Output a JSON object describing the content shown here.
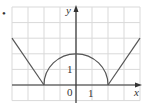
{
  "figure": {
    "marker": "•",
    "axis_labels": {
      "x": "x",
      "y": "y"
    },
    "tick_labels": {
      "origin": "0",
      "x_one": "1",
      "y_one": "1"
    }
  },
  "chart_data": {
    "type": "line",
    "title": "",
    "xlabel": "x",
    "ylabel": "y",
    "grid": true,
    "xlim": [
      -4,
      4
    ],
    "ylim": [
      -1,
      5
    ],
    "series": [
      {
        "name": "left line",
        "x": [
          -4,
          -2
        ],
        "y": [
          3,
          0
        ]
      },
      {
        "name": "semicircle",
        "shape": "upper semicircle centered (0,0) radius 2",
        "x": [
          -2,
          -1,
          0,
          1,
          2
        ],
        "y": [
          0,
          1.73,
          2,
          1.73,
          0
        ]
      },
      {
        "name": "right line",
        "x": [
          2,
          4
        ],
        "y": [
          0,
          3
        ]
      }
    ],
    "annotations": [
      "0",
      "1 (x-axis)",
      "1 (y-axis)"
    ]
  },
  "colors": {
    "grid": "#d9d9d9",
    "axis": "#333333",
    "curve": "#555555"
  }
}
